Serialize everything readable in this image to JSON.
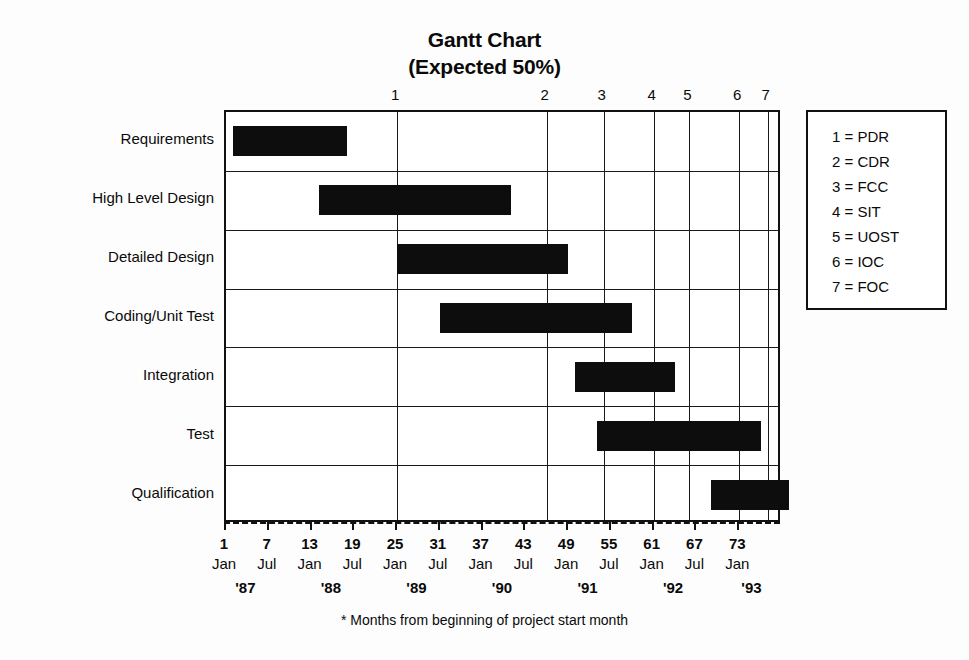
{
  "title": {
    "line1": "Gantt Chart",
    "line2": "(Expected 50%)"
  },
  "footnote": "* Months from beginning of project start month",
  "colors": {
    "bar": "#0d0d0d",
    "frame": "#111111",
    "background": "#fdfdfd",
    "text": "#0a0a0a"
  },
  "legend": {
    "items": [
      {
        "key": "1",
        "label": "1 = PDR"
      },
      {
        "key": "2",
        "label": "2 = CDR"
      },
      {
        "key": "3",
        "label": "3 = FCC"
      },
      {
        "key": "4",
        "label": "4 = SIT"
      },
      {
        "key": "5",
        "label": "5 = UOST"
      },
      {
        "key": "6",
        "label": "6 = IOC"
      },
      {
        "key": "7",
        "label": "7 = FOC"
      }
    ]
  },
  "chart_data": {
    "type": "bar",
    "title": "Gantt Chart (Expected 50%)",
    "xlabel": "* Months from beginning of project start month",
    "ylabel": "",
    "xlim": [
      1,
      79
    ],
    "grid": true,
    "legend_position": "right",
    "categories": [
      "Requirements",
      "High Level Design",
      "Detailed Design",
      "Coding/Unit Test",
      "Integration",
      "Test",
      "Qualification"
    ],
    "tasks": [
      {
        "name": "Requirements",
        "start_month": 2,
        "end_month": 18,
        "row": 0
      },
      {
        "name": "High Level Design",
        "start_month": 14,
        "end_month": 41,
        "row": 1
      },
      {
        "name": "Detailed Design",
        "start_month": 25,
        "end_month": 49,
        "row": 2
      },
      {
        "name": "Coding/Unit Test",
        "start_month": 31,
        "end_month": 58,
        "row": 3
      },
      {
        "name": "Integration",
        "start_month": 50,
        "end_month": 64,
        "row": 4
      },
      {
        "name": "Test",
        "start_month": 53,
        "end_month": 76,
        "row": 5
      },
      {
        "name": "Qualification",
        "start_month": 69,
        "end_month": 80,
        "row": 6
      }
    ],
    "x_ticks": [
      {
        "month": 1,
        "monthname": "Jan"
      },
      {
        "month": 7,
        "monthname": "Jul"
      },
      {
        "month": 13,
        "monthname": "Jan"
      },
      {
        "month": 19,
        "monthname": "Jul"
      },
      {
        "month": 25,
        "monthname": "Jan"
      },
      {
        "month": 31,
        "monthname": "Jul"
      },
      {
        "month": 37,
        "monthname": "Jan"
      },
      {
        "month": 43,
        "monthname": "Jul"
      },
      {
        "month": 49,
        "monthname": "Jan"
      },
      {
        "month": 55,
        "monthname": "Jul"
      },
      {
        "month": 61,
        "monthname": "Jan"
      },
      {
        "month": 67,
        "monthname": "Jul"
      },
      {
        "month": 73,
        "monthname": "Jan"
      }
    ],
    "years": [
      {
        "label": "'87",
        "month": 4
      },
      {
        "label": "'88",
        "month": 16
      },
      {
        "label": "'89",
        "month": 28
      },
      {
        "label": "'90",
        "month": 40
      },
      {
        "label": "'91",
        "month": 52
      },
      {
        "label": "'92",
        "month": 64
      },
      {
        "label": "'93",
        "month": 75
      }
    ],
    "milestones": [
      {
        "label": "1",
        "name": "PDR",
        "month": 25
      },
      {
        "label": "2",
        "name": "CDR",
        "month": 46
      },
      {
        "label": "3",
        "name": "FCC",
        "month": 54
      },
      {
        "label": "4",
        "name": "SIT",
        "month": 61
      },
      {
        "label": "5",
        "name": "UOST",
        "month": 66
      },
      {
        "label": "6",
        "name": "IOC",
        "month": 73
      },
      {
        "label": "7",
        "name": "FOC",
        "month": 77
      }
    ]
  }
}
